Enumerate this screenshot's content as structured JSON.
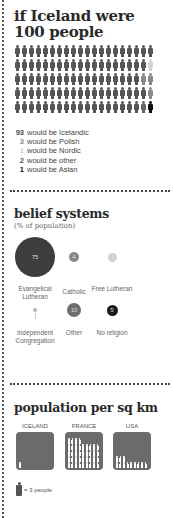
{
  "section1": {
    "title": "if Iceland were 100 people",
    "grid": {
      "columns": 20,
      "rows": 5,
      "default_color": "#555555",
      "overrides": [
        {
          "row": 1,
          "col": 19,
          "color": "#d2d2d2"
        },
        {
          "row": 2,
          "col": 18,
          "color": "#8a8a8a"
        },
        {
          "row": 2,
          "col": 19,
          "color": "#8a8a8a"
        },
        {
          "row": 3,
          "col": 19,
          "color": "#8a8a8a"
        },
        {
          "row": 4,
          "col": 18,
          "color": "#666666"
        },
        {
          "row": 4,
          "col": 19,
          "color": "#111111"
        }
      ]
    },
    "legend": [
      {
        "num": "93",
        "text": "would be Icelandic",
        "color": "#444444"
      },
      {
        "num": "3",
        "text": "would be Polish",
        "color": "#8a8a8a"
      },
      {
        "num": "1",
        "text": "would be Nordic",
        "color": "#d2d2d2"
      },
      {
        "num": "2",
        "text": "would be other",
        "color": "#555555"
      },
      {
        "num": "1",
        "text": "would be Asian",
        "color": "#111111"
      }
    ]
  },
  "section2": {
    "title": "belief systems",
    "subtitle": "(% of population)",
    "bubbles": [
      {
        "label": "Evangelical Lutheran",
        "value": "75",
        "color": "#3d3d3d",
        "size": 40,
        "cx": 35,
        "cy": 257,
        "ly": 285
      },
      {
        "label": "Catholic",
        "value": "4",
        "color": "#888888",
        "size": 10,
        "cx": 74,
        "cy": 257,
        "ly": 288
      },
      {
        "label": "Free Lutheran",
        "value": "3",
        "color": "#d0d0d0",
        "size": 9,
        "cx": 112,
        "cy": 257,
        "ly": 285
      },
      {
        "label": "Independent Congregation",
        "value": "1",
        "color": "#b5b5b5",
        "size": 4,
        "cx": 35,
        "cy": 310,
        "ly": 329
      },
      {
        "label": "Other",
        "value": "10",
        "color": "#6e6e6e",
        "size": 14,
        "cx": 74,
        "cy": 310,
        "ly": 329
      },
      {
        "label": "No religion",
        "value": "5",
        "color": "#1a1a1a",
        "size": 11,
        "cx": 112,
        "cy": 310,
        "ly": 329
      }
    ]
  },
  "section3": {
    "title": "population per sq km",
    "countries": [
      {
        "name": "ICELAND",
        "figures": 1,
        "x": 16
      },
      {
        "name": "FRANCE",
        "figures": 40,
        "x": 65
      },
      {
        "name": "USA",
        "figures": 12,
        "x": 113
      }
    ],
    "key_text": "= 3 people"
  }
}
